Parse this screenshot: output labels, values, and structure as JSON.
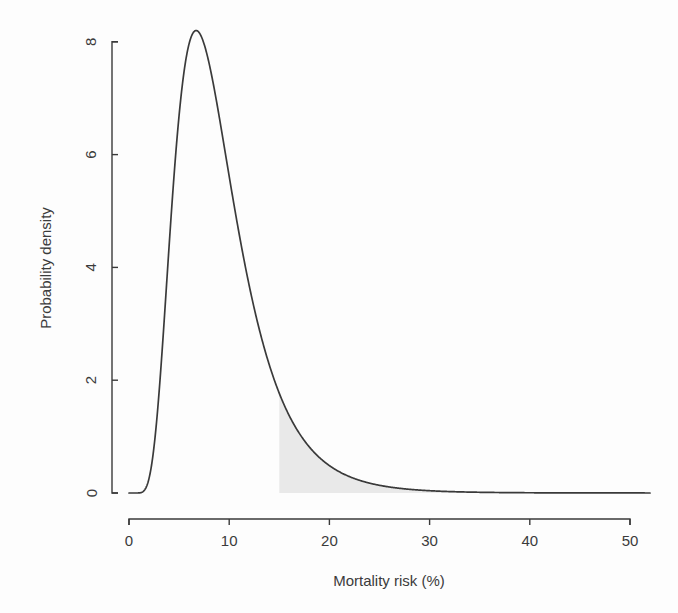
{
  "chart_data": {
    "type": "area",
    "title": "",
    "subtitle": "",
    "xlabel": "Mortality risk (%)",
    "ylabel": "Probability density",
    "xlim": [
      0,
      52
    ],
    "ylim": [
      0,
      8.6
    ],
    "xticks": [
      0,
      10,
      20,
      30,
      40,
      50
    ],
    "xtick_labels": [
      "0",
      "10",
      "20",
      "30",
      "40",
      "50"
    ],
    "yticks": [
      0,
      2,
      4,
      6,
      8
    ],
    "ytick_labels": [
      "0",
      "2",
      "4",
      "6",
      "8"
    ],
    "grid": false,
    "legend": null,
    "series": [
      {
        "name": "Probability density of mortality risk",
        "curve_color": "#3a3a3a",
        "peak_x": 6.7,
        "peak_y": 8.2,
        "x": [
          0.0,
          0.5,
          1.0,
          1.5,
          2.0,
          2.5,
          3.0,
          3.5,
          4.0,
          4.5,
          5.0,
          5.5,
          6.0,
          6.5,
          7.0,
          7.5,
          8.0,
          8.5,
          9.0,
          9.5,
          10.0,
          11.0,
          12.0,
          13.0,
          14.0,
          15.0,
          16.0,
          17.0,
          18.0,
          19.0,
          20.0,
          21.0,
          22.0,
          23.0,
          24.0,
          25.0,
          26.0,
          27.0,
          28.0,
          29.0,
          30.0,
          32.0,
          34.0,
          36.0,
          38.0,
          40.0,
          44.0,
          48.0,
          52.0
        ],
        "y": [
          0.0,
          0.01,
          0.18,
          1.1,
          2.7,
          4.4,
          5.9,
          6.95,
          7.65,
          8.05,
          8.2,
          8.18,
          8.05,
          7.8,
          7.45,
          7.05,
          6.6,
          6.15,
          5.7,
          5.25,
          4.8,
          4.0,
          3.3,
          2.75,
          2.3,
          3.1,
          2.55,
          2.1,
          1.75,
          1.45,
          1.2,
          1.0,
          0.83,
          0.68,
          0.56,
          0.46,
          0.38,
          0.31,
          0.26,
          0.21,
          0.17,
          0.115,
          0.078,
          0.053,
          0.036,
          0.025,
          0.012,
          0.006,
          0.003
        ]
      }
    ],
    "annotations": [
      {
        "name": "shaded-tail-region",
        "type": "area-fill",
        "description": "Shaded area under the density curve for mortality risk at or above threshold",
        "x_start": 15,
        "x_end": 52,
        "fill_color": "#e9e9e9"
      }
    ]
  },
  "axes": {
    "x": {
      "title": "Mortality risk (%)",
      "labels": [
        "0",
        "10",
        "20",
        "30",
        "40",
        "50"
      ]
    },
    "y": {
      "title": "Probability density",
      "labels": [
        "0",
        "2",
        "4",
        "6",
        "8"
      ]
    }
  }
}
